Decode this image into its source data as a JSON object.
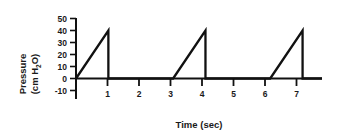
{
  "chart_data": {
    "type": "line",
    "title": "",
    "subtitle": "",
    "xlabel": "Time (sec)",
    "ylabel_line1": "Pressure",
    "ylabel_line2_prefix": "(cm H",
    "ylabel_line2_sub": "2",
    "ylabel_line2_suffix": "O)",
    "ylabel_full": "Pressure (cm H2O)",
    "xlim": [
      0,
      7.6
    ],
    "ylim": [
      -10,
      50
    ],
    "xticks": [
      1,
      2,
      3,
      4,
      5,
      6,
      7
    ],
    "xtick_labels": [
      "1",
      "2",
      "3",
      "4",
      "5",
      "6",
      "7"
    ],
    "yticks": [
      -10,
      0,
      10,
      20,
      30,
      40,
      50
    ],
    "ytick_labels": [
      "-10",
      "0",
      "10",
      "20",
      "30",
      "40",
      "50"
    ],
    "grid": false,
    "legend": "none",
    "line_color": "#111111",
    "axis_color": "#111111",
    "background_color": "#ffffff",
    "series": [
      {
        "name": "Airway pressure",
        "waveform": "sawtooth",
        "peak_value": 40,
        "baseline_value": 0,
        "ramp_duration_sec": 1,
        "cycle_period_sec": 3,
        "cycle_starts": [
          0,
          3,
          6
        ],
        "x": [
          0,
          1,
          1,
          3,
          4,
          4,
          6,
          7,
          7,
          7.6
        ],
        "y": [
          0,
          40,
          0,
          0,
          40,
          0,
          0,
          40,
          0,
          0
        ]
      }
    ]
  },
  "axes": {
    "x_axis_name": "time-axis",
    "y_axis_name": "pressure-axis"
  }
}
